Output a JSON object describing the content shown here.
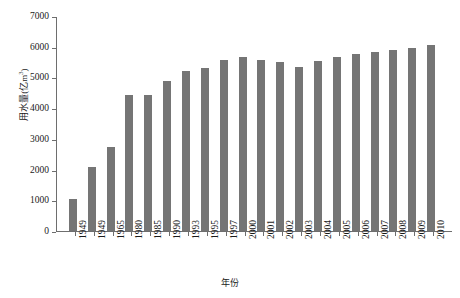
{
  "chart_data": {
    "type": "bar",
    "title": "",
    "xlabel": "年份",
    "ylabel": "用水量(亿m³)",
    "ylabel_base": "用水量(亿m",
    "ylabel_sup": "3",
    "ylabel_tail": ")",
    "ylim": [
      0,
      7000
    ],
    "ytick_step": 1000,
    "yticks": [
      0,
      1000,
      2000,
      3000,
      4000,
      5000,
      6000,
      7000
    ],
    "ytick_labels": [
      "0",
      "1000",
      "2000",
      "3000",
      "4000",
      "5000",
      "6000",
      "7000"
    ],
    "grid": false,
    "legend": false,
    "bar_color": "#757575",
    "axis_color": "#6e6e6e",
    "categories": [
      "1949",
      "1949",
      "1965",
      "1980",
      "1985",
      "1990",
      "1993",
      "1995",
      "1997",
      "2000",
      "2001",
      "2002",
      "2003",
      "2004",
      "2005",
      "2006",
      "2007",
      "2008",
      "2009",
      "2010"
    ],
    "series": [
      {
        "name": "用水量",
        "values": [
          1030,
          2070,
          2750,
          4440,
          4440,
          4880,
          5200,
          5320,
          5570,
          5650,
          5570,
          5500,
          5350,
          5550,
          5660,
          5750,
          5820,
          5900,
          5950,
          6050
        ]
      }
    ]
  }
}
